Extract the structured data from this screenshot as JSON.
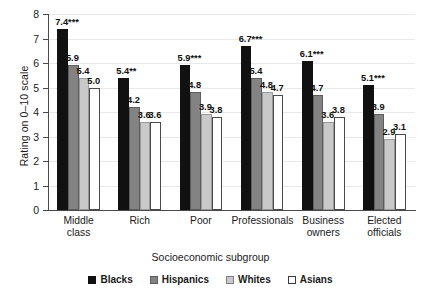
{
  "chart_data": {
    "type": "bar",
    "title": "",
    "xlabel": "Socioeconomic subgroup",
    "ylabel": "Rating on 0–10 scale",
    "ylim": [
      0,
      8
    ],
    "yticks": [
      "0",
      "1",
      "2",
      "3",
      "4",
      "5",
      "6",
      "7",
      "8"
    ],
    "grid": true,
    "legend_position": "bottom",
    "categories": [
      "Middle class",
      "Rich",
      "Poor",
      "Professionals",
      "Business owners",
      "Elected officials"
    ],
    "category_lines": [
      [
        "Middle",
        "class"
      ],
      [
        "Rich"
      ],
      [
        "Poor"
      ],
      [
        "Professionals"
      ],
      [
        "Business",
        "owners"
      ],
      [
        "Elected",
        "officials"
      ]
    ],
    "series": [
      {
        "name": "Blacks",
        "color": "#111111",
        "values": [
          7.4,
          5.4,
          5.9,
          6.7,
          6.1,
          5.1
        ],
        "labels": [
          "7.4***",
          "5.4**",
          "5.9***",
          "6.7***",
          "6.1***",
          "5.1***"
        ]
      },
      {
        "name": "Hispanics",
        "color": "#838383",
        "values": [
          5.9,
          4.2,
          4.8,
          5.4,
          4.7,
          3.9
        ],
        "labels": [
          "5.9",
          "4.2",
          "4.8",
          "5.4",
          "4.7",
          "3.9"
        ]
      },
      {
        "name": "Whites",
        "color": "#c9c9c9",
        "values": [
          5.4,
          3.6,
          3.9,
          4.8,
          3.6,
          2.9
        ],
        "labels": [
          "5.4",
          "3.6",
          "3.9",
          "4.8",
          "3.6",
          "2.9"
        ]
      },
      {
        "name": "Asians",
        "color": "#ffffff",
        "values": [
          5.0,
          3.6,
          3.8,
          4.7,
          3.8,
          3.1
        ],
        "labels": [
          "5.0",
          "3.6",
          "3.8",
          "4.7",
          "3.8",
          "3.1"
        ]
      }
    ]
  }
}
